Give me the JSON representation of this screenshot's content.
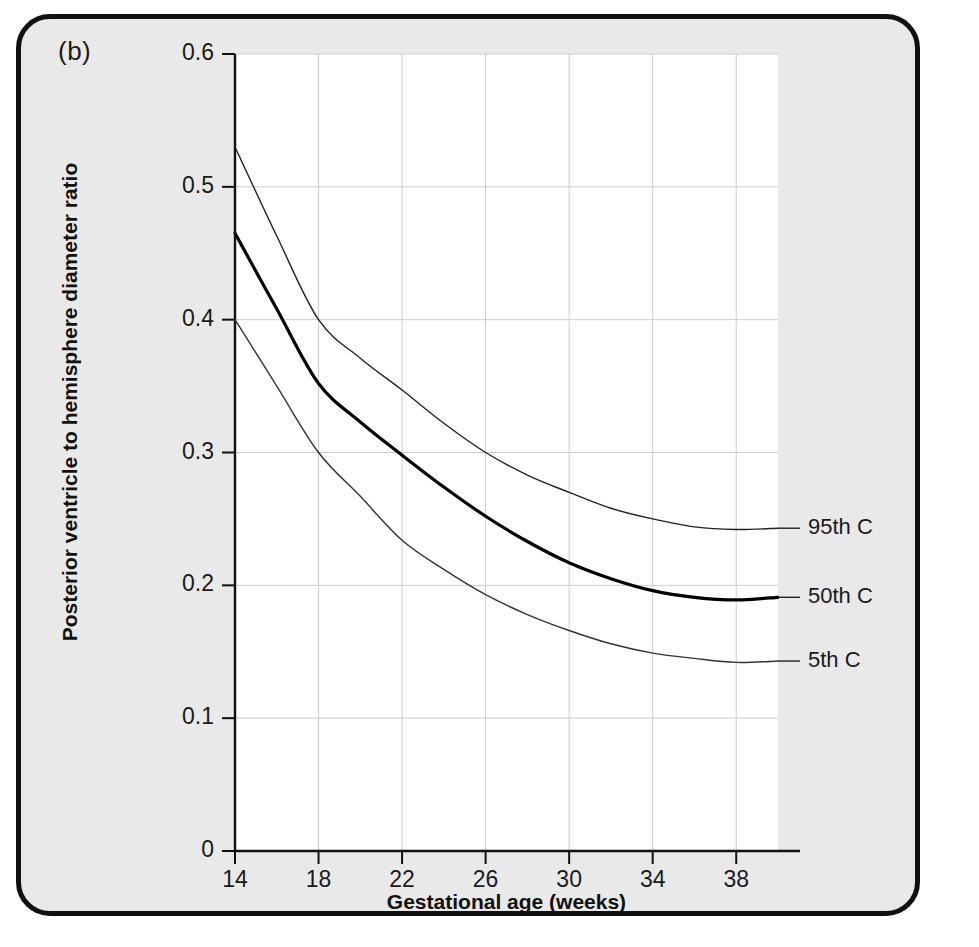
{
  "figure": {
    "panel_label": "(b)",
    "frame_color": "#111111",
    "background_color": "#e9e9e9",
    "plot_background_color": "#ffffff"
  },
  "chart_data": {
    "type": "line",
    "title": "",
    "subtitle": "",
    "xlabel": "Gestational age (weeks)",
    "ylabel": "Posterior ventricle to hemisphere diameter ratio",
    "xlim": [
      14,
      40
    ],
    "ylim": [
      0,
      0.6
    ],
    "xticks": [
      14,
      18,
      22,
      26,
      30,
      34,
      38
    ],
    "xtick_labels": [
      "14",
      "18",
      "22",
      "26",
      "30",
      "34",
      "38"
    ],
    "yticks": [
      0,
      0.1,
      0.2,
      0.3,
      0.4,
      0.5,
      0.6
    ],
    "ytick_labels": [
      "0",
      "0.1",
      "0.2",
      "0.3",
      "0.4",
      "0.5",
      "0.6"
    ],
    "grid": true,
    "grid_color": "#cccccc",
    "legend_position": "right-inline-labels",
    "x": [
      14,
      16,
      18,
      20,
      22,
      24,
      26,
      28,
      30,
      32,
      34,
      36,
      38,
      40
    ],
    "series": [
      {
        "name": "95th C",
        "label": "95th C",
        "color": "#222222",
        "line_width": 1.4,
        "values": [
          0.53,
          0.463,
          0.4,
          0.371,
          0.347,
          0.322,
          0.3,
          0.283,
          0.27,
          0.258,
          0.25,
          0.244,
          0.242,
          0.243
        ]
      },
      {
        "name": "50th C",
        "label": "50th C",
        "color": "#000000",
        "line_width": 3.2,
        "values": [
          0.465,
          0.408,
          0.352,
          0.323,
          0.298,
          0.274,
          0.252,
          0.233,
          0.217,
          0.205,
          0.196,
          0.191,
          0.189,
          0.191
        ]
      },
      {
        "name": "5th C",
        "label": "5th C",
        "color": "#333333",
        "line_width": 1.4,
        "values": [
          0.4,
          0.35,
          0.3,
          0.267,
          0.234,
          0.212,
          0.193,
          0.178,
          0.166,
          0.156,
          0.149,
          0.145,
          0.142,
          0.143
        ]
      }
    ],
    "annotations": [
      {
        "text": "95th C",
        "x": 40,
        "y": 0.243
      },
      {
        "text": "50th C",
        "x": 40,
        "y": 0.191
      },
      {
        "text": "5th C",
        "x": 40,
        "y": 0.143
      }
    ]
  }
}
